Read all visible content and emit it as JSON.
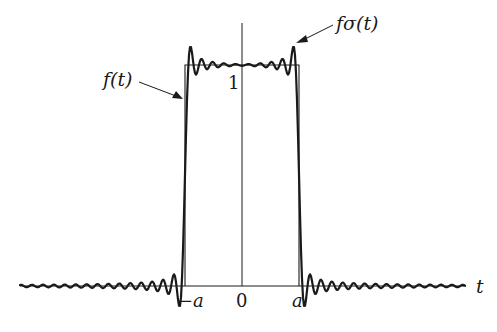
{
  "diagram": {
    "type": "signal-plot",
    "labels": {
      "f_sigma": "fσ(t)",
      "f": "f(t)",
      "height": "1",
      "t_axis": "t",
      "minus_a": "−a",
      "zero": "0",
      "a": "a"
    },
    "colors": {
      "stroke": "#1a1a1a",
      "background": "#ffffff"
    },
    "geometry": {
      "baseline_y": 286,
      "axis_x": 242,
      "rect_left": 185,
      "rect_right": 299,
      "rect_top": 65,
      "x_start": 20,
      "x_end": 465
    }
  }
}
